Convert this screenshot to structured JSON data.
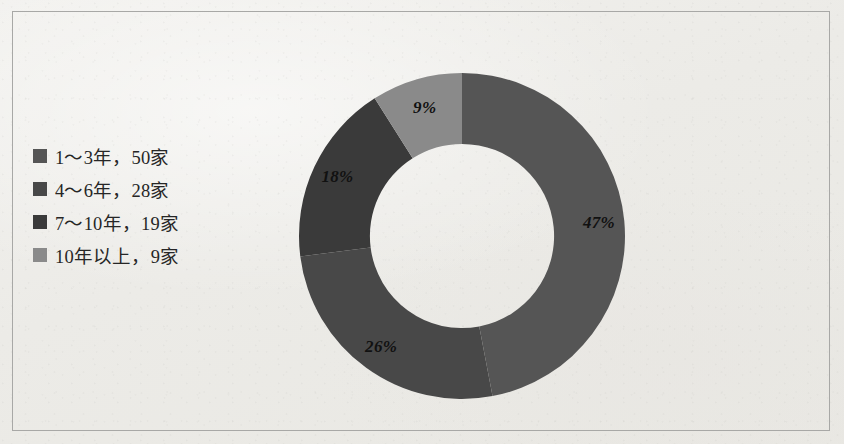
{
  "figure": {
    "background_color": "#edece8",
    "frame_color": "#a8a8a6"
  },
  "legend": {
    "items": [
      {
        "label": "1～3年，50家",
        "color": "#555555"
      },
      {
        "label": "4～6年，28家",
        "color": "#484848"
      },
      {
        "label": "7～10年，19家",
        "color": "#3a3a3a"
      },
      {
        "label": "10年以上，9家",
        "color": "#8a8a8a"
      }
    ]
  },
  "chart_data": {
    "type": "pie",
    "variant": "doughnut",
    "title": "",
    "xlabel": "",
    "ylabel": "",
    "start_angle_deg": 0,
    "direction": "clockwise",
    "inner_radius_ratio": 0.565,
    "legend_position": "left",
    "grid": false,
    "categories": [
      "1～3年",
      "4～6年",
      "7～10年",
      "10年以上"
    ],
    "values": [
      50,
      28,
      19,
      9
    ],
    "value_unit": "家",
    "total": 106,
    "percent_labels": [
      "47%",
      "26%",
      "18%",
      "9%"
    ],
    "percents": [
      47,
      26,
      18,
      9
    ],
    "colors": [
      "#555555",
      "#484848",
      "#3a3a3a",
      "#8a8a8a"
    ],
    "slices": [
      {
        "name": "1～3年",
        "value": 50,
        "percent": 47,
        "label": "47%",
        "color": "#555555"
      },
      {
        "name": "4～6年",
        "value": 28,
        "percent": 26,
        "label": "26%",
        "color": "#484848"
      },
      {
        "name": "7～10年",
        "value": 19,
        "percent": 18,
        "label": "18%",
        "color": "#3a3a3a"
      },
      {
        "name": "10年以上",
        "value": 9,
        "percent": 9,
        "label": "9%",
        "color": "#8a8a8a"
      }
    ]
  }
}
